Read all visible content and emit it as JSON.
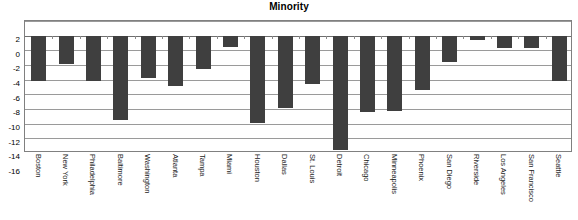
{
  "chart_data": {
    "type": "bar",
    "title": "Minority",
    "xlabel": "",
    "ylabel": "",
    "ylim": [
      -16,
      2
    ],
    "yticks": [
      2,
      0,
      -2,
      -4,
      -6,
      -8,
      -10,
      -12,
      -14,
      -16
    ],
    "ytick_labels": [
      "2",
      "0",
      "-2",
      "-4",
      "-6",
      "-8",
      "-10",
      "-12",
      "-14",
      "-16"
    ],
    "grid": true,
    "legend": "none",
    "bar_color": "#3f3f3f",
    "categories": [
      "Boston",
      "New York",
      "Philadelphia",
      "Baltimore",
      "Washington",
      "Atlanta",
      "Tampa",
      "Miami",
      "Houston",
      "Dallas",
      "St. Louis",
      "Detroit",
      "Chicago",
      "Minneapolis",
      "Phoenix",
      "San Diego",
      "Riverside",
      "Los Angeles",
      "San Francisco",
      "Seattle"
    ],
    "values": [
      -6.2,
      -3.8,
      -6.2,
      -11.5,
      -5.7,
      -6.8,
      -4.5,
      -1.5,
      -11.8,
      -9.8,
      -6.5,
      -15.5,
      -10.3,
      -10.2,
      -7.3,
      -3.5,
      -0.5,
      -1.7,
      -1.6,
      -6.2
    ]
  }
}
